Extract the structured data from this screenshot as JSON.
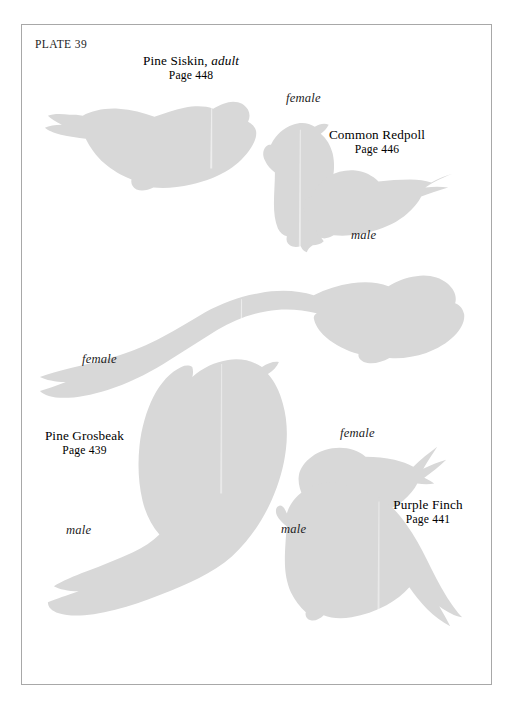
{
  "plate": {
    "id_label": "PLATE 39",
    "background_color": "#ffffff",
    "border_color": "#a8a8a8",
    "silhouette_color": "#d8d8d8",
    "text_color": "#1c1c1c"
  },
  "species": [
    {
      "key": "pine_siskin",
      "name_main": "Pine Siskin,",
      "name_italic": "adult",
      "page_ref": "Page 448",
      "sex_labels": []
    },
    {
      "key": "common_redpoll",
      "name_main": "Common Redpoll",
      "name_italic": "",
      "page_ref": "Page 446",
      "sex_labels": [
        "female",
        "male"
      ]
    },
    {
      "key": "pine_grosbeak",
      "name_main": "Pine Grosbeak",
      "name_italic": "",
      "page_ref": "Page 439",
      "sex_labels": [
        "female",
        "male"
      ]
    },
    {
      "key": "purple_finch",
      "name_main": "Purple Finch",
      "name_italic": "",
      "page_ref": "Page 441",
      "sex_labels": [
        "female",
        "male"
      ]
    }
  ],
  "labels": {
    "siskin_name": "Pine Siskin,",
    "siskin_name_italic": "adult",
    "siskin_page": "Page 448",
    "redpoll_name": "Common Redpoll",
    "redpoll_page": "Page 446",
    "redpoll_female": "female",
    "redpoll_male": "male",
    "grosbeak_name": "Pine Grosbeak",
    "grosbeak_page": "Page 439",
    "grosbeak_female": "female",
    "grosbeak_male": "male",
    "finch_name": "Purple Finch",
    "finch_page": "Page 441",
    "finch_female": "female",
    "finch_male": "male"
  },
  "figures": [
    {
      "name": "pine-siskin-adult-silhouette",
      "species": "Pine Siskin",
      "sex": "adult",
      "orientation": "perched, facing right"
    },
    {
      "name": "common-redpoll-female-silhouette",
      "species": "Common Redpoll",
      "sex": "female",
      "orientation": "upright, facing left"
    },
    {
      "name": "common-redpoll-male-silhouette",
      "species": "Common Redpoll",
      "sex": "male",
      "orientation": "perched, facing left"
    },
    {
      "name": "pine-grosbeak-female-silhouette",
      "species": "Pine Grosbeak",
      "sex": "female",
      "orientation": "perched, facing right"
    },
    {
      "name": "pine-grosbeak-male-silhouette",
      "species": "Pine Grosbeak",
      "sex": "male",
      "orientation": "upright, facing right"
    },
    {
      "name": "purple-finch-female-silhouette",
      "species": "Purple Finch",
      "sex": "female",
      "orientation": "perched, facing left"
    },
    {
      "name": "purple-finch-male-silhouette",
      "species": "Purple Finch",
      "sex": "male",
      "orientation": "perched, facing left"
    }
  ]
}
